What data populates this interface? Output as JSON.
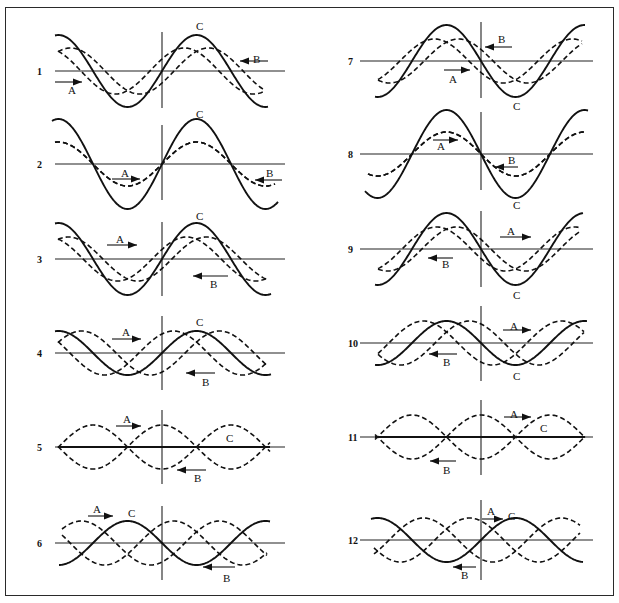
{
  "figure": {
    "legend": {
      "A": "dashed wave travelling right",
      "B": "dashed wave travelling left",
      "C": "solid resultant wave"
    },
    "colors": {
      "ink": "#111111",
      "background": "#ffffff",
      "frame": "#2a2a2a"
    },
    "panels": [
      {
        "number": "1",
        "col": 0,
        "baseline_y": 71,
        "vline": [
          32,
          108
        ],
        "x0": 58,
        "x1": 265,
        "solid_amp": 36,
        "solid_phase": 0,
        "dashed_amp": 23,
        "a_shift": -0.55,
        "b_shift": 0.55,
        "solid_ext": [
          55,
          268
        ],
        "solid_start_phase": 0,
        "labels": [
          {
            "t": "C",
            "x": 196,
            "y": 30
          },
          {
            "t": "B",
            "x": 253,
            "y": 63
          },
          {
            "t": "A",
            "x": 68,
            "y": 94
          }
        ],
        "arrows": [
          {
            "x1": 55,
            "y1": 82,
            "x2": 82,
            "y2": 82
          },
          {
            "x1": 268,
            "y1": 61,
            "x2": 240,
            "y2": 61
          }
        ]
      },
      {
        "number": "2",
        "col": 0,
        "baseline_y": 164,
        "vline": [
          125,
          200
        ],
        "x0": 55,
        "x1": 275,
        "solid_amp": 45,
        "solid_phase": 0,
        "dashed_amp": 22,
        "a_shift": 0,
        "b_shift": 0,
        "labels": [
          {
            "t": "C",
            "x": 196,
            "y": 118
          },
          {
            "t": "A",
            "x": 121,
            "y": 177
          },
          {
            "t": "B",
            "x": 266,
            "y": 177
          }
        ],
        "arrows": [
          {
            "x1": 112,
            "y1": 179,
            "x2": 140,
            "y2": 179
          },
          {
            "x1": 282,
            "y1": 180,
            "x2": 255,
            "y2": 180
          }
        ]
      },
      {
        "number": "3",
        "col": 0,
        "baseline_y": 259,
        "vline": [
          222,
          296
        ],
        "x0": 58,
        "x1": 268,
        "solid_amp": 36,
        "solid_phase": 0,
        "dashed_amp": 22,
        "a_shift": -0.45,
        "b_shift": 0.45,
        "labels": [
          {
            "t": "C",
            "x": 196,
            "y": 220
          },
          {
            "t": "A",
            "x": 116,
            "y": 243
          },
          {
            "t": "B",
            "x": 210,
            "y": 288
          }
        ],
        "arrows": [
          {
            "x1": 107,
            "y1": 245,
            "x2": 137,
            "y2": 245
          },
          {
            "x1": 228,
            "y1": 276,
            "x2": 193,
            "y2": 276
          }
        ]
      },
      {
        "number": "4",
        "col": 0,
        "baseline_y": 353,
        "vline": [
          316,
          390
        ],
        "x0": 58,
        "x1": 268,
        "solid_amp": 22,
        "solid_phase": 0,
        "dashed_amp": 22,
        "a_shift": -1.05,
        "b_shift": 1.05,
        "labels": [
          {
            "t": "C",
            "x": 196,
            "y": 326
          },
          {
            "t": "A",
            "x": 122,
            "y": 336
          },
          {
            "t": "B",
            "x": 202,
            "y": 386
          }
        ],
        "arrows": [
          {
            "x1": 112,
            "y1": 339,
            "x2": 141,
            "y2": 339
          },
          {
            "x1": 215,
            "y1": 373,
            "x2": 186,
            "y2": 373
          }
        ]
      },
      {
        "number": "5",
        "col": 0,
        "baseline_y": 447,
        "vline": [
          410,
          484
        ],
        "x0": 58,
        "x1": 270,
        "solid_amp": 0,
        "solid_phase": 0,
        "dashed_amp": 22,
        "a_shift": 0,
        "b_shift": 0,
        "standing": true,
        "labels": [
          {
            "t": "C",
            "x": 226,
            "y": 442
          },
          {
            "t": "A",
            "x": 123,
            "y": 423
          },
          {
            "t": "B",
            "x": 194,
            "y": 482
          }
        ],
        "arrows": [
          {
            "x1": 116,
            "y1": 426,
            "x2": 141,
            "y2": 426
          },
          {
            "x1": 206,
            "y1": 470,
            "x2": 177,
            "y2": 470
          }
        ]
      },
      {
        "number": "6",
        "col": 0,
        "baseline_y": 543,
        "vline": [
          506,
          580
        ],
        "x0": 62,
        "x1": 267,
        "solid_amp": 22,
        "solid_phase": 3.14159,
        "dashed_amp": 22,
        "a_shift": 2.1,
        "b_shift": -2.1,
        "labels": [
          {
            "t": "A",
            "x": 93,
            "y": 513
          },
          {
            "t": "C",
            "x": 128,
            "y": 517
          },
          {
            "t": "B",
            "x": 223,
            "y": 582
          }
        ],
        "arrows": [
          {
            "x1": 88,
            "y1": 516,
            "x2": 113,
            "y2": 516
          },
          {
            "x1": 235,
            "y1": 567,
            "x2": 203,
            "y2": 567
          }
        ]
      },
      {
        "number": "7",
        "col": 1,
        "baseline_y": 61,
        "vline": [
          22,
          98
        ],
        "x0": 378,
        "x1": 582,
        "solid_amp": 36,
        "solid_phase": 3.14159,
        "dashed_amp": 22,
        "a_shift": -0.55,
        "b_shift": 0.55,
        "labels": [
          {
            "t": "B",
            "x": 498,
            "y": 43
          },
          {
            "t": "A",
            "x": 449,
            "y": 83
          },
          {
            "t": "C",
            "x": 513,
            "y": 110
          }
        ],
        "arrows": [
          {
            "x1": 512,
            "y1": 47,
            "x2": 485,
            "y2": 47
          },
          {
            "x1": 444,
            "y1": 70,
            "x2": 470,
            "y2": 70
          }
        ]
      },
      {
        "number": "8",
        "col": 1,
        "baseline_y": 154,
        "vline": [
          112,
          190
        ],
        "x0": 368,
        "x1": 585,
        "solid_amp": 44,
        "solid_phase": 3.14159,
        "dashed_amp": 22,
        "a_shift": 0,
        "b_shift": 0,
        "labels": [
          {
            "t": "A",
            "x": 437,
            "y": 150
          },
          {
            "t": "B",
            "x": 508,
            "y": 164
          },
          {
            "t": "C",
            "x": 513,
            "y": 209
          }
        ],
        "arrows": [
          {
            "x1": 433,
            "y1": 140,
            "x2": 458,
            "y2": 140
          },
          {
            "x1": 518,
            "y1": 167,
            "x2": 495,
            "y2": 167
          }
        ]
      },
      {
        "number": "9",
        "col": 1,
        "baseline_y": 249,
        "vline": [
          211,
          287
        ],
        "x0": 378,
        "x1": 580,
        "solid_amp": 36,
        "solid_phase": 3.14159,
        "dashed_amp": 22,
        "a_shift": 0.45,
        "b_shift": -0.45,
        "labels": [
          {
            "t": "A",
            "x": 507,
            "y": 235
          },
          {
            "t": "B",
            "x": 442,
            "y": 268
          },
          {
            "t": "C",
            "x": 513,
            "y": 299
          }
        ],
        "arrows": [
          {
            "x1": 500,
            "y1": 237,
            "x2": 531,
            "y2": 237
          },
          {
            "x1": 453,
            "y1": 258,
            "x2": 428,
            "y2": 258
          }
        ]
      },
      {
        "number": "10",
        "col": 1,
        "baseline_y": 343,
        "vline": [
          306,
          381
        ],
        "x0": 378,
        "x1": 584,
        "solid_amp": 22,
        "solid_phase": 3.14159,
        "dashed_amp": 22,
        "a_shift": 1.05,
        "b_shift": -1.05,
        "labels": [
          {
            "t": "A",
            "x": 510,
            "y": 330
          },
          {
            "t": "B",
            "x": 443,
            "y": 366
          },
          {
            "t": "C",
            "x": 513,
            "y": 380
          }
        ],
        "arrows": [
          {
            "x1": 503,
            "y1": 330,
            "x2": 531,
            "y2": 330
          },
          {
            "x1": 457,
            "y1": 354,
            "x2": 429,
            "y2": 354
          }
        ]
      },
      {
        "number": "11",
        "col": 1,
        "baseline_y": 437,
        "vline": [
          400,
          475
        ],
        "x0": 375,
        "x1": 585,
        "solid_amp": 0,
        "solid_phase": 0,
        "dashed_amp": 22,
        "a_shift": 0,
        "b_shift": 0,
        "standing": true,
        "labels": [
          {
            "t": "A",
            "x": 510,
            "y": 418
          },
          {
            "t": "C",
            "x": 540,
            "y": 432
          },
          {
            "t": "B",
            "x": 443,
            "y": 474
          }
        ],
        "arrows": [
          {
            "x1": 504,
            "y1": 417,
            "x2": 531,
            "y2": 417
          },
          {
            "x1": 456,
            "y1": 461,
            "x2": 430,
            "y2": 461
          }
        ]
      },
      {
        "number": "12",
        "col": 1,
        "baseline_y": 540,
        "vline": [
          500,
          580
        ],
        "x0": 374,
        "x1": 580,
        "solid_amp": 22,
        "solid_phase": 0,
        "dashed_amp": 22,
        "a_shift": -2.1,
        "b_shift": 2.1,
        "labels": [
          {
            "t": "A",
            "x": 487,
            "y": 515
          },
          {
            "t": "C",
            "x": 508,
            "y": 520
          },
          {
            "t": "B",
            "x": 461,
            "y": 579
          }
        ],
        "arrows": [
          {
            "x1": 482,
            "y1": 519,
            "x2": 503,
            "y2": 519
          },
          {
            "x1": 476,
            "y1": 567,
            "x2": 453,
            "y2": 567
          }
        ]
      }
    ],
    "columns": [
      {
        "label_x": 37,
        "vline_x": 162,
        "axis_x0": 55,
        "axis_x1": 285,
        "wavelength": 138
      },
      {
        "label_x": 348,
        "vline_x": 481,
        "axis_x0": 360,
        "axis_x1": 593,
        "wavelength": 138
      }
    ]
  }
}
